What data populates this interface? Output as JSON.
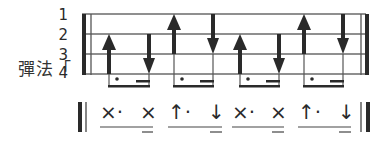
{
  "label": "彈法「",
  "strings": [
    "1",
    "2",
    "3",
    "4"
  ],
  "strokes": [
    {
      "dir": "up",
      "top_string": 2
    },
    {
      "dir": "down",
      "top_string": 2
    },
    {
      "dir": "up",
      "top_string": 1
    },
    {
      "dir": "down",
      "top_string": 1
    },
    {
      "dir": "up",
      "top_string": 2
    },
    {
      "dir": "down",
      "top_string": 2
    },
    {
      "dir": "up",
      "top_string": 1
    },
    {
      "dir": "down",
      "top_string": 1
    }
  ],
  "notation": [
    "×·",
    "×",
    "↑·",
    "↓",
    "×·",
    "×",
    "↑·",
    "↓"
  ],
  "colors": {
    "ink": "#2a2a2a",
    "line": "#6a6a6a"
  }
}
